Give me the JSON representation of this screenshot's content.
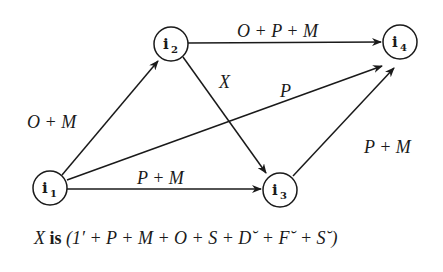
{
  "diagram": {
    "nodes": [
      {
        "id": "i1",
        "label": "i",
        "sub": "1",
        "cx": 50,
        "cy": 188
      },
      {
        "id": "i2",
        "label": "i",
        "sub": "2",
        "cx": 171,
        "cy": 44
      },
      {
        "id": "i3",
        "label": "i",
        "sub": "3",
        "cx": 280,
        "cy": 190
      },
      {
        "id": "i4",
        "label": "i",
        "sub": "4",
        "cx": 400,
        "cy": 42
      }
    ],
    "edges": [
      {
        "from": "i1",
        "to": "i2",
        "label": "O + M"
      },
      {
        "from": "i2",
        "to": "i4",
        "label": "O + P + M"
      },
      {
        "from": "i2",
        "to": "i3",
        "label": "X"
      },
      {
        "from": "i1",
        "to": "i4",
        "label": "P"
      },
      {
        "from": "i1",
        "to": "i3",
        "label": "P + M"
      },
      {
        "from": "i3",
        "to": "i4",
        "label": "P + M"
      }
    ],
    "caption": {
      "var": "X",
      "is": "is",
      "expr": "(1′ + P + M + O + S + D˘ + F˘ + S˘)"
    }
  }
}
